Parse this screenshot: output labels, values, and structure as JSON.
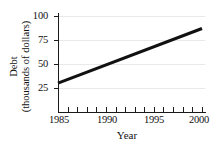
{
  "chart_data": {
    "type": "line",
    "title": "",
    "subtitle": "",
    "xlabel": "Year",
    "ylabel_line1": "Debt",
    "ylabel_line2": "(thousands of dollars)",
    "ylabel": "Debt (thousands of dollars)",
    "xlim": [
      1985,
      2000
    ],
    "ylim": [
      0,
      105
    ],
    "xticks": [
      1985,
      1986,
      1987,
      1988,
      1989,
      1990,
      1991,
      1992,
      1993,
      1994,
      1995,
      1996,
      1997,
      1998,
      1999,
      2000
    ],
    "xtick_labels": [
      "1985",
      "",
      "",
      "",
      "",
      "1990",
      "",
      "",
      "",
      "",
      "1995",
      "",
      "",
      "",
      "",
      "2000"
    ],
    "xtick_labeled": [
      "1985",
      "1990",
      "1995",
      "2000"
    ],
    "yticks": [
      25,
      50,
      75,
      100
    ],
    "ytick_labels": [
      "25",
      "50",
      "75",
      "100"
    ],
    "grid": true,
    "grid_axis": "y",
    "grid_color": "#e9e9e9",
    "legend": false,
    "legend_position": "none",
    "line_color": "#111111",
    "line_width_px": 3,
    "series": [
      {
        "name": "Debt",
        "x": [
          1985,
          1986,
          1987,
          1988,
          1989,
          1990,
          1991,
          1992,
          1993,
          1994,
          1995,
          1996,
          1997,
          1998,
          1999,
          2000
        ],
        "values": [
          30.0,
          33.8,
          37.6,
          41.4,
          45.2,
          49.0,
          52.8,
          56.6,
          60.4,
          64.2,
          68.0,
          71.8,
          75.6,
          79.4,
          83.2,
          87.0
        ],
        "endpoints": {
          "start": {
            "x": 1985,
            "y": 30
          },
          "end": {
            "x": 2000,
            "y": 87
          }
        }
      }
    ]
  }
}
